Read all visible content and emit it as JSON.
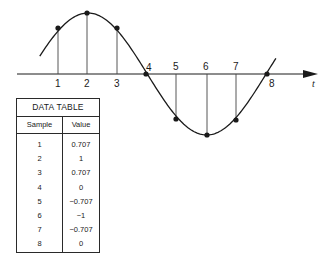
{
  "chart_data": {
    "type": "line",
    "title": "",
    "xlabel": "t",
    "ylabel": "",
    "x": [
      1,
      2,
      3,
      4,
      5,
      6,
      7,
      8
    ],
    "series": [
      {
        "name": "Value",
        "values": [
          0.707,
          1,
          0.707,
          0,
          -0.707,
          -1,
          -0.707,
          0
        ]
      }
    ],
    "ylim": [
      -1,
      1
    ],
    "grid": false,
    "legend": null
  },
  "axis": {
    "t_label": "t",
    "sample_labels": [
      "1",
      "2",
      "3",
      "4",
      "5",
      "6",
      "7",
      "8"
    ]
  },
  "table": {
    "title": "DATA TABLE",
    "headers": [
      "Sample",
      "Value"
    ],
    "rows": [
      [
        "1",
        "0.707"
      ],
      [
        "2",
        "1"
      ],
      [
        "3",
        "0.707"
      ],
      [
        "4",
        "0"
      ],
      [
        "5",
        "−0.707"
      ],
      [
        "6",
        "−1"
      ],
      [
        "7",
        "−0.707"
      ],
      [
        "8",
        "0"
      ]
    ]
  },
  "colors": {
    "ink": "#1a1a1a",
    "stem": "#444444",
    "background": "#ffffff"
  }
}
